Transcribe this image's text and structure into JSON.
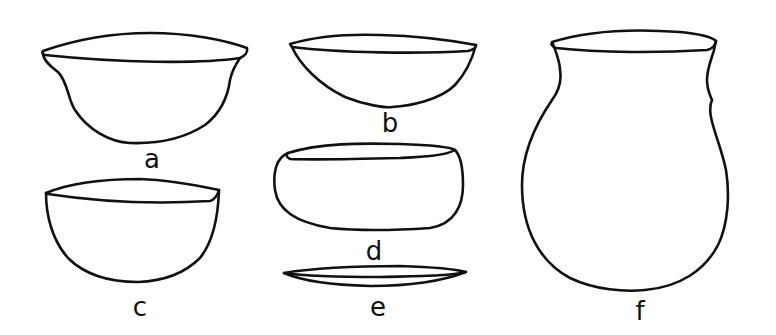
{
  "figure": {
    "stroke_color": "#111111",
    "background": "#ffffff",
    "vessels": [
      {
        "id": "a",
        "label": "a",
        "shape": "bowl with flaring everted rim"
      },
      {
        "id": "b",
        "label": "b",
        "shape": "shallow hemispherical bowl"
      },
      {
        "id": "c",
        "label": "c",
        "shape": "deep hemispherical bowl"
      },
      {
        "id": "d",
        "label": "d",
        "shape": "squat incurved-rim bowl"
      },
      {
        "id": "e",
        "label": "e",
        "shape": "flat plate / dish"
      },
      {
        "id": "f",
        "label": "f",
        "shape": "globular jar with short flared neck"
      }
    ]
  }
}
